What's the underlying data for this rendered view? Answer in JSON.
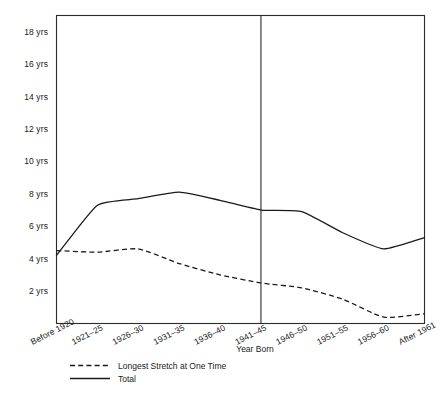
{
  "chart_data": {
    "type": "line",
    "title": "",
    "subtitle": "",
    "xlabel": "Year Born",
    "ylabel": "",
    "grid": false,
    "legend_position": "bottom-left",
    "categories": [
      "Before 1920",
      "1921–25",
      "1926–30",
      "1931–35",
      "1936–40",
      "1941–45",
      "1946–50",
      "1951–55",
      "1956–60",
      "After 1961"
    ],
    "ylim": [
      0,
      19
    ],
    "ytick_values": [
      2,
      4,
      6,
      8,
      10,
      12,
      14,
      16,
      18
    ],
    "ytick_labels": [
      "2 yrs",
      "4 yrs",
      "6 yrs",
      "8 yrs",
      "10 yrs",
      "12 yrs",
      "14 yrs",
      "16 yrs",
      "18 yrs"
    ],
    "annotations": [
      {
        "name": "vertical-divider",
        "type": "vline",
        "at_category": "1941–45",
        "label": ""
      }
    ],
    "series": [
      {
        "name": "Longest Stretch at One Time",
        "style": "dashed",
        "color": "#1a1a1a",
        "values": [
          4.5,
          4.4,
          4.6,
          3.7,
          3.0,
          2.5,
          2.2,
          1.5,
          0.4,
          0.6
        ]
      },
      {
        "name": "Total",
        "style": "solid",
        "color": "#1a1a1a",
        "values": [
          4.2,
          7.3,
          7.7,
          8.1,
          7.6,
          7.0,
          6.9,
          5.6,
          4.6,
          5.3
        ]
      }
    ]
  },
  "legend": {
    "entries": [
      {
        "label": "Longest Stretch at One Time",
        "style": "dashed"
      },
      {
        "label": "Total",
        "style": "solid"
      }
    ]
  },
  "axis": {
    "x_title": "Year Born"
  },
  "colors": {
    "ink": "#1a1a1a",
    "frame": "#2b2b2b",
    "background": "#ffffff"
  }
}
